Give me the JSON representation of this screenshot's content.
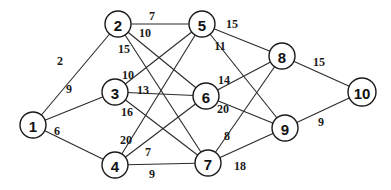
{
  "diagram": {
    "type": "weighted-graph",
    "nodes": [
      {
        "id": "1",
        "label": "1",
        "x": 33,
        "y": 125
      },
      {
        "id": "2",
        "label": "2",
        "x": 118,
        "y": 24
      },
      {
        "id": "3",
        "label": "3",
        "x": 115,
        "y": 92
      },
      {
        "id": "4",
        "label": "4",
        "x": 115,
        "y": 165
      },
      {
        "id": "5",
        "label": "5",
        "x": 202,
        "y": 24
      },
      {
        "id": "6",
        "label": "6",
        "x": 206,
        "y": 96
      },
      {
        "id": "7",
        "label": "7",
        "x": 208,
        "y": 163
      },
      {
        "id": "8",
        "label": "8",
        "x": 282,
        "y": 56
      },
      {
        "id": "9",
        "label": "9",
        "x": 285,
        "y": 128
      },
      {
        "id": "10",
        "label": "10",
        "x": 362,
        "y": 92
      }
    ],
    "edges": [
      {
        "from": "1",
        "to": "2",
        "weight": "2",
        "lx": 60,
        "ly": 61
      },
      {
        "from": "1",
        "to": "3",
        "weight": "9",
        "lx": 69,
        "ly": 89
      },
      {
        "from": "1",
        "to": "4",
        "weight": "6",
        "lx": 57,
        "ly": 131
      },
      {
        "from": "2",
        "to": "5",
        "weight": "7",
        "lx": 152,
        "ly": 16
      },
      {
        "from": "2",
        "to": "6",
        "weight": "10",
        "lx": 145,
        "ly": 33
      },
      {
        "from": "2",
        "to": "7",
        "weight": "15",
        "lx": 124,
        "ly": 49
      },
      {
        "from": "3",
        "to": "5",
        "weight": "10",
        "lx": 128,
        "ly": 75
      },
      {
        "from": "3",
        "to": "6",
        "weight": "13",
        "lx": 143,
        "ly": 90
      },
      {
        "from": "3",
        "to": "7",
        "weight": "16",
        "lx": 127,
        "ly": 112
      },
      {
        "from": "4",
        "to": "5",
        "weight": "20",
        "lx": 126,
        "ly": 140
      },
      {
        "from": "4",
        "to": "6",
        "weight": "7",
        "lx": 148,
        "ly": 152
      },
      {
        "from": "4",
        "to": "7",
        "weight": "9",
        "lx": 152,
        "ly": 174
      },
      {
        "from": "5",
        "to": "8",
        "weight": "15",
        "lx": 232,
        "ly": 24
      },
      {
        "from": "5",
        "to": "9",
        "weight": "11",
        "lx": 220,
        "ly": 46
      },
      {
        "from": "6",
        "to": "8",
        "weight": "14",
        "lx": 224,
        "ly": 80
      },
      {
        "from": "6",
        "to": "9",
        "weight": "20",
        "lx": 223,
        "ly": 109
      },
      {
        "from": "7",
        "to": "8",
        "weight": "8",
        "lx": 227,
        "ly": 136
      },
      {
        "from": "7",
        "to": "9",
        "weight": "18",
        "lx": 240,
        "ly": 166
      },
      {
        "from": "8",
        "to": "10",
        "weight": "15",
        "lx": 319,
        "ly": 62
      },
      {
        "from": "9",
        "to": "10",
        "weight": "9",
        "lx": 321,
        "ly": 122
      }
    ]
  }
}
